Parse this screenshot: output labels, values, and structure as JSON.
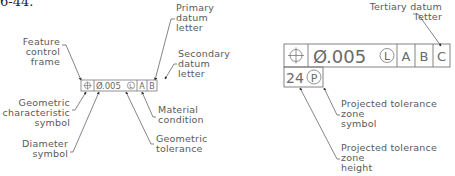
{
  "figure": {
    "number_fragment": "6-44."
  },
  "left_diagram": {
    "frame": {
      "geometric_characteristic_symbol": "⊕",
      "diameter_symbol": "Ø",
      "tolerance_value": ".005",
      "material_condition": "L",
      "datums": [
        "A",
        "B"
      ]
    },
    "callouts": {
      "feature_control_frame": "Feature\ncontrol\nframe",
      "primary_datum_letter": "Primary\ndatum\nletter",
      "secondary_datum_letter": "Secondary\ndatum\nletter",
      "geometric_characteristic_symbol": "Geometric\ncharacteristic\nsymbol",
      "diameter_symbol": "Diameter\nsymbol",
      "material_condition": "Material\ncondition",
      "geometric_tolerance": "Geometric\ntolerance"
    }
  },
  "right_diagram": {
    "frame": {
      "geometric_characteristic_symbol": "⊕",
      "diameter_symbol": "Ø",
      "tolerance_value": ".005",
      "material_condition": "L",
      "datums": [
        "A",
        "B",
        "C"
      ],
      "projected_zone_height": "24",
      "projected_zone_symbol": "P"
    },
    "callouts": {
      "tertiary_datum_letter": "Tertiary datum\nletter",
      "projected_tolerance_zone_symbol": "Projected tolerance\nzone\nsymbol",
      "projected_tolerance_zone_height": "Projected tolerance\nzone\nheight"
    }
  }
}
